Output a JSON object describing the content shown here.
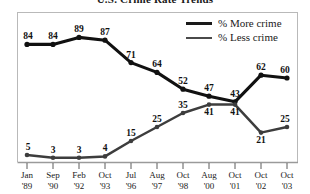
{
  "chart_data": {
    "type": "line",
    "title": "U.S. Crime Rate Trends",
    "xlabel": "",
    "ylabel": "",
    "ylim": [
      0,
      100
    ],
    "grid": false,
    "legend_position": "top-right",
    "categories": [
      "Jan '89",
      "Sep '90",
      "Feb '92",
      "Oct '93",
      "Jul '96",
      "Aug '97",
      "Oct '98",
      "Aug '00",
      "Oct '01",
      "Oct '02",
      "Oct '03"
    ],
    "tick_lines": [
      {
        "month": "Jan",
        "year": "'89"
      },
      {
        "month": "Sep",
        "year": "'90"
      },
      {
        "month": "Feb",
        "year": "'92"
      },
      {
        "month": "Oct",
        "year": "'93"
      },
      {
        "month": "Jul",
        "year": "'96"
      },
      {
        "month": "Aug",
        "year": "'97"
      },
      {
        "month": "Oct",
        "year": "'98"
      },
      {
        "month": "Aug",
        "year": "'00"
      },
      {
        "month": "Oct",
        "year": "'01"
      },
      {
        "month": "Oct",
        "year": "'02"
      },
      {
        "month": "Oct",
        "year": "'03"
      }
    ],
    "series": [
      {
        "name": "% More crime",
        "color": "#111111",
        "values": [
          84,
          84,
          89,
          87,
          71,
          64,
          52,
          47,
          43,
          62,
          60
        ]
      },
      {
        "name": "% Less crime",
        "color": "#3d3d3d",
        "values": [
          5,
          3,
          3,
          4,
          15,
          25,
          35,
          41,
          41,
          21,
          25
        ]
      }
    ]
  },
  "legend": {
    "items": [
      {
        "label": "% More crime"
      },
      {
        "label": "% Less crime"
      }
    ]
  }
}
